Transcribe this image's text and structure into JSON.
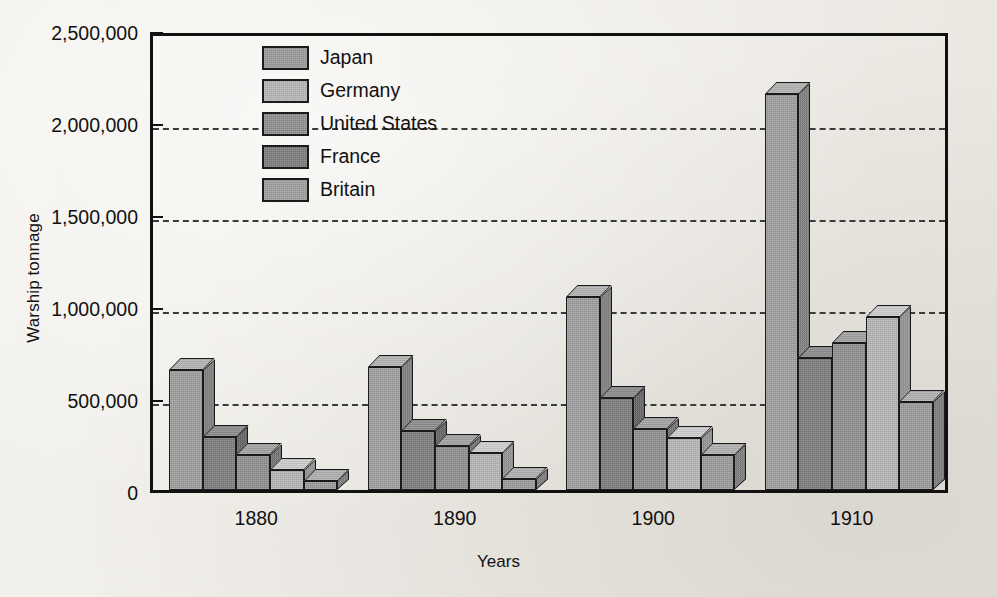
{
  "figure": {
    "y_axis_title": "Warship tonnage",
    "x_axis_title": "Years"
  },
  "legend": {
    "items": [
      {
        "label": "Japan",
        "color": "#9a9a9a"
      },
      {
        "label": "Germany",
        "color": "#b6b6b6"
      },
      {
        "label": "United States",
        "color": "#8e8e8e"
      },
      {
        "label": "France",
        "color": "#7a7a7a"
      },
      {
        "label": "Britain",
        "color": "#9d9d9d"
      }
    ]
  },
  "chart_data": {
    "type": "bar",
    "title": "",
    "xlabel": "Years",
    "ylabel": "Warship tonnage",
    "categories": [
      "1880",
      "1890",
      "1900",
      "1910"
    ],
    "ylim": [
      0,
      2500000
    ],
    "ytick_labels": [
      "0",
      "500,000",
      "1,000,000",
      "1,500,000",
      "2,000,000",
      "2,500,000"
    ],
    "ytick_values": [
      0,
      500000,
      1000000,
      1500000,
      2000000,
      2500000
    ],
    "grid": "horizontal-dashed",
    "legend_position": "inside-top-left",
    "bar_order_in_group": [
      "Britain",
      "France",
      "United States",
      "Germany",
      "Japan"
    ],
    "series": [
      {
        "name": "Britain",
        "color": "#9d9d9d",
        "values": [
          650000,
          670000,
          1050000,
          2150000
        ]
      },
      {
        "name": "France",
        "color": "#7a7a7a",
        "values": [
          290000,
          320000,
          500000,
          720000
        ]
      },
      {
        "name": "United States",
        "color": "#8e8e8e",
        "values": [
          190000,
          240000,
          330000,
          800000
        ]
      },
      {
        "name": "Germany",
        "color": "#b6b6b6",
        "values": [
          110000,
          200000,
          285000,
          940000
        ]
      },
      {
        "name": "Japan",
        "color": "#9a9a9a",
        "values": [
          50000,
          60000,
          190000,
          480000
        ]
      }
    ]
  }
}
